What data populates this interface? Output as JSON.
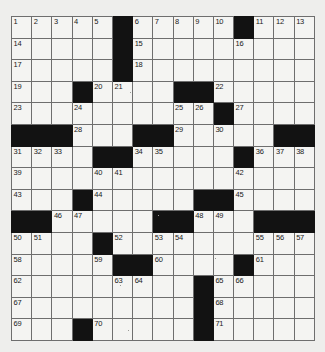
{
  "puzzle": {
    "type": "crossword-grid",
    "rows": 15,
    "cols": 15,
    "cell_background": "#f4f4f2",
    "block_color": "#121212",
    "grid_line_color": "#6e6e6e",
    "page_background": "#eeeeec",
    "grid": [
      [
        {
          "n": "1"
        },
        {
          "n": "2"
        },
        {
          "n": "3"
        },
        {
          "n": "4"
        },
        {
          "n": "5"
        },
        {
          "b": true
        },
        {
          "n": "6"
        },
        {
          "n": "7"
        },
        {
          "n": "8"
        },
        {
          "n": "9"
        },
        {
          "n": "10"
        },
        {
          "b": true
        },
        {
          "n": "11"
        },
        {
          "n": "12"
        },
        {
          "n": "13"
        }
      ],
      [
        {
          "n": "14"
        },
        {},
        {},
        {},
        {},
        {
          "b": true
        },
        {
          "n": "15"
        },
        {},
        {},
        {},
        {},
        {
          "n": "16"
        },
        {},
        {},
        {}
      ],
      [
        {
          "n": "17"
        },
        {},
        {},
        {},
        {},
        {
          "b": true
        },
        {
          "n": "18"
        },
        {},
        {},
        {},
        {},
        {},
        {},
        {},
        {}
      ],
      [
        {
          "n": "19"
        },
        {},
        {},
        {
          "b": true
        },
        {
          "n": "20"
        },
        {
          "n": "21"
        },
        {},
        {},
        {
          "b": true
        },
        {
          "b": true
        },
        {
          "n": "22"
        },
        {},
        {},
        {},
        {}
      ],
      [
        {
          "n": "23"
        },
        {},
        {},
        {
          "n": "24"
        },
        {},
        {},
        {},
        {},
        {
          "n": "25"
        },
        {
          "n": "26"
        },
        {
          "b": true
        },
        {
          "n": "27"
        },
        {},
        {},
        {}
      ],
      [
        {
          "b": true
        },
        {
          "b": true
        },
        {
          "b": true
        },
        {
          "n": "28"
        },
        {},
        {},
        {
          "b": true
        },
        {
          "b": true
        },
        {
          "n": "29"
        },
        {},
        {
          "n": "30"
        },
        {},
        {},
        {
          "b": true
        },
        {
          "b": true
        }
      ],
      [
        {
          "n": "31"
        },
        {
          "n": "32"
        },
        {
          "n": "33"
        },
        {},
        {
          "b": true
        },
        {
          "b": true
        },
        {
          "n": "34"
        },
        {
          "n": "35"
        },
        {},
        {},
        {},
        {
          "b": true
        },
        {
          "n": "36"
        },
        {
          "n": "37"
        },
        {
          "n": "38"
        }
      ],
      [
        {
          "n": "39"
        },
        {},
        {},
        {},
        {
          "n": "40"
        },
        {
          "n": "41"
        },
        {},
        {},
        {},
        {},
        {},
        {
          "n": "42"
        },
        {},
        {},
        {}
      ],
      [
        {
          "n": "43"
        },
        {},
        {},
        {
          "b": true
        },
        {
          "n": "44"
        },
        {},
        {},
        {},
        {},
        {
          "b": true
        },
        {
          "b": true
        },
        {
          "n": "45"
        },
        {},
        {},
        {}
      ],
      [
        {
          "b": true
        },
        {
          "b": true
        },
        {
          "n": "46"
        },
        {
          "n": "47"
        },
        {},
        {},
        {},
        {
          "b": true
        },
        {
          "b": true
        },
        {
          "n": "48"
        },
        {
          "n": "49"
        },
        {},
        {
          "b": true
        },
        {
          "b": true
        },
        {
          "b": true
        }
      ],
      [
        {
          "n": "50"
        },
        {
          "n": "51"
        },
        {},
        {},
        {
          "b": true
        },
        {
          "n": "52"
        },
        {},
        {
          "n": "53"
        },
        {
          "n": "54"
        },
        {},
        {},
        {},
        {
          "n": "55"
        },
        {
          "n": "56"
        },
        {
          "n": "57"
        }
      ],
      [
        {
          "n": "58"
        },
        {},
        {},
        {},
        {
          "n": "59"
        },
        {
          "b": true
        },
        {
          "b": true
        },
        {
          "n": "60"
        },
        {},
        {},
        {},
        {
          "b": true
        },
        {
          "n": "61"
        },
        {},
        {}
      ],
      [
        {
          "n": "62"
        },
        {},
        {},
        {},
        {},
        {
          "n": "63"
        },
        {
          "n": "64"
        },
        {},
        {},
        {
          "b": true
        },
        {
          "n": "65"
        },
        {
          "n": "66"
        },
        {},
        {},
        {}
      ],
      [
        {
          "n": "67"
        },
        {},
        {},
        {},
        {},
        {},
        {},
        {},
        {},
        {
          "b": true
        },
        {
          "n": "68"
        },
        {},
        {},
        {},
        {}
      ],
      [
        {
          "n": "69"
        },
        {},
        {},
        {
          "b": true
        },
        {
          "n": "70"
        },
        {},
        {},
        {},
        {},
        {
          "b": true
        },
        {
          "n": "71"
        },
        {},
        {},
        {},
        {}
      ]
    ]
  }
}
